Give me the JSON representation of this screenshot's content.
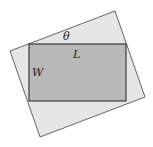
{
  "diagram": {
    "labels": {
      "theta": "θ",
      "length": "L",
      "width": "W"
    },
    "colors": {
      "background": "#ffffff",
      "outer_fill": "#e6e6e6",
      "inner_fill": "#b9b9b9",
      "stroke": "#3a3a3a"
    },
    "outer_polygon": [
      [
        115,
        11
      ],
      [
        145,
        97
      ],
      [
        40,
        137
      ],
      [
        10,
        51
      ]
    ],
    "inner_rect": {
      "x": 29,
      "y": 44,
      "width": 97,
      "height": 57
    }
  }
}
